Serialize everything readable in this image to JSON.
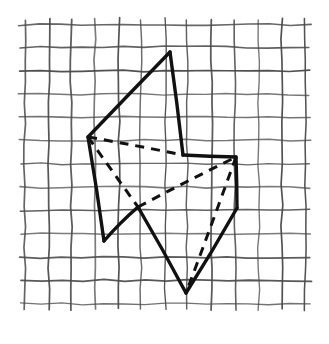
{
  "figure": {
    "background_color": "#ffffff",
    "ink_color": "#1a1a1a",
    "grid_color": "#555555"
  },
  "grid": {
    "name": "hand-drawn-graph-paper",
    "columns": 12,
    "rows": 12,
    "cell_size": 23.3,
    "origin_x": 25.0,
    "origin_y": 24.5,
    "line_color": "#4a4a4a",
    "line_width": 1.3,
    "hand_drawn": true,
    "wobble_amplitude": 1.1,
    "overshoot": 4
  },
  "shape": {
    "name": "polyhedron",
    "stroke_color": "#111111",
    "solid_stroke_width": 3.4,
    "dashed_stroke_width": 3.0,
    "dash_pattern": "9,7",
    "vertices": {
      "A_top_apex": [
        170,
        52
      ],
      "B_left": [
        88,
        137
      ],
      "C_notch": [
        138,
        207
      ],
      "D_lower_left": [
        104,
        241
      ],
      "E_mid_top": [
        183,
        155
      ],
      "F_right_top": [
        236,
        157
      ],
      "G_right_lower": [
        237,
        208
      ],
      "H_bottom": [
        186,
        293
      ]
    },
    "solid_edges": [
      {
        "name": "apex-to-left",
        "from": "A_top_apex",
        "to": "B_left"
      },
      {
        "name": "apex-to-mid-top",
        "from": "A_top_apex",
        "to": "E_mid_top"
      },
      {
        "name": "left-to-lower-left",
        "from": "B_left",
        "to": "D_lower_left"
      },
      {
        "name": "lower-left-to-notch",
        "from": "D_lower_left",
        "to": "C_notch"
      },
      {
        "name": "notch-to-bottom",
        "from": "C_notch",
        "to": "H_bottom"
      },
      {
        "name": "mid-top-to-right-top",
        "from": "E_mid_top",
        "to": "F_right_top"
      },
      {
        "name": "right-top-to-right-lower",
        "from": "F_right_top",
        "to": "G_right_lower"
      },
      {
        "name": "right-lower-to-bottom",
        "from": "G_right_lower",
        "to": "H_bottom"
      }
    ],
    "dashed_edges": [
      {
        "name": "hidden-left-to-mid-top",
        "from": "B_left",
        "to": "E_mid_top"
      },
      {
        "name": "hidden-left-to-notch",
        "from": "B_left",
        "to": "C_notch"
      },
      {
        "name": "hidden-notch-to-right-top",
        "from": "C_notch",
        "to": "F_right_top"
      },
      {
        "name": "hidden-right-top-to-bottom",
        "from": "F_right_top",
        "to": "H_bottom"
      }
    ]
  }
}
